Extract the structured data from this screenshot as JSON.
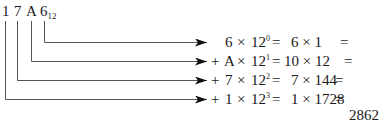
{
  "number": {
    "digits": [
      "1",
      "7",
      "A",
      "6"
    ],
    "base_subscript": "12"
  },
  "expansion": [
    {
      "sign": "",
      "digit": "6",
      "times": "×",
      "base": "12",
      "exp": "0",
      "eq1": "=",
      "expanded": "6 × 1",
      "eq2": "=",
      "value": "6"
    },
    {
      "sign": "+",
      "digit": "A",
      "times": "×",
      "base": "12",
      "exp": "1",
      "eq1": "=",
      "expanded": "10 × 12",
      "eq2": "=",
      "value": "120"
    },
    {
      "sign": "+",
      "digit": "7",
      "times": "×",
      "base": "12",
      "exp": "2",
      "eq1": "=",
      "expanded": "7 × 144",
      "eq2": "=",
      "value": "1008"
    },
    {
      "sign": "+",
      "digit": "1",
      "times": "×",
      "base": "12",
      "exp": "3",
      "eq1": "=",
      "expanded": "1 × 1728",
      "eq2": "=",
      "value": "1728"
    }
  ],
  "total": "2862",
  "colors": {
    "line": "#555555",
    "arrow": "#111111",
    "text": "#1a1a1a"
  }
}
